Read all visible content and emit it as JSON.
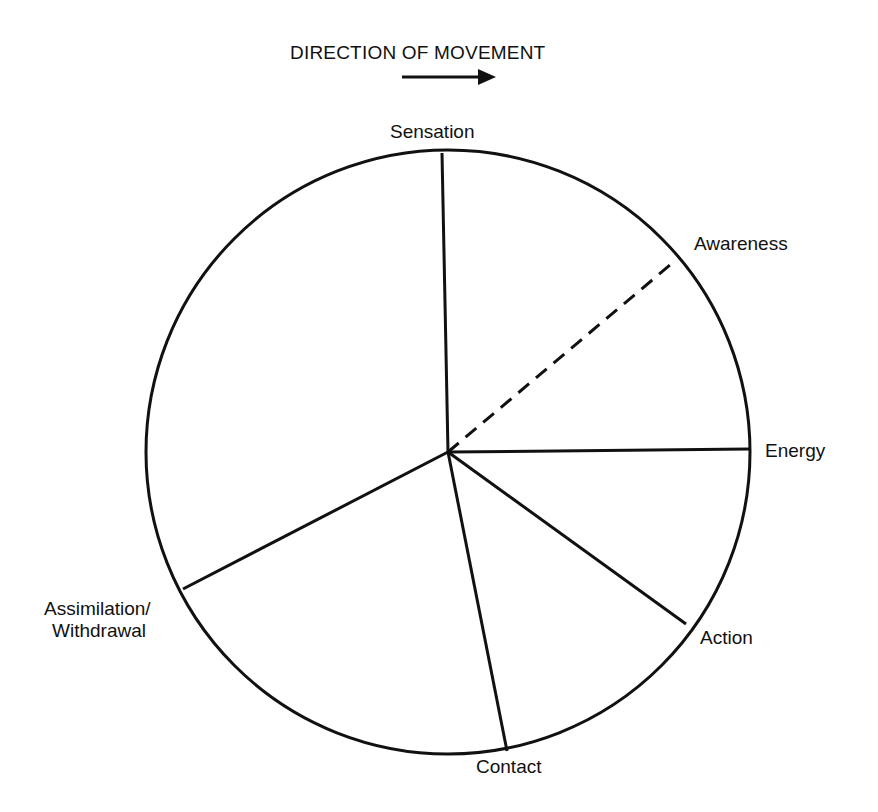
{
  "header": {
    "title": "DIRECTION OF MOVEMENT",
    "arrow_icon": "right-arrow-icon"
  },
  "diagram": {
    "type": "cycle-wheel",
    "center": [
      448,
      452
    ],
    "radius": 302,
    "stroke_color": "#111111",
    "stages": [
      {
        "label": "Sensation",
        "end": [
          442,
          153
        ],
        "dashed": false
      },
      {
        "label": "Awareness",
        "end": [
          676,
          260
        ],
        "dashed": true
      },
      {
        "label": "Energy",
        "end": [
          749,
          449
        ],
        "dashed": false
      },
      {
        "label": "Action",
        "end": [
          686,
          624
        ],
        "dashed": false
      },
      {
        "label": "Contact",
        "end": [
          507,
          751
        ],
        "dashed": false
      },
      {
        "label_line1": "Assimilation/",
        "label_line2": "Withdrawal",
        "end": [
          183,
          589
        ],
        "dashed": false
      }
    ]
  }
}
